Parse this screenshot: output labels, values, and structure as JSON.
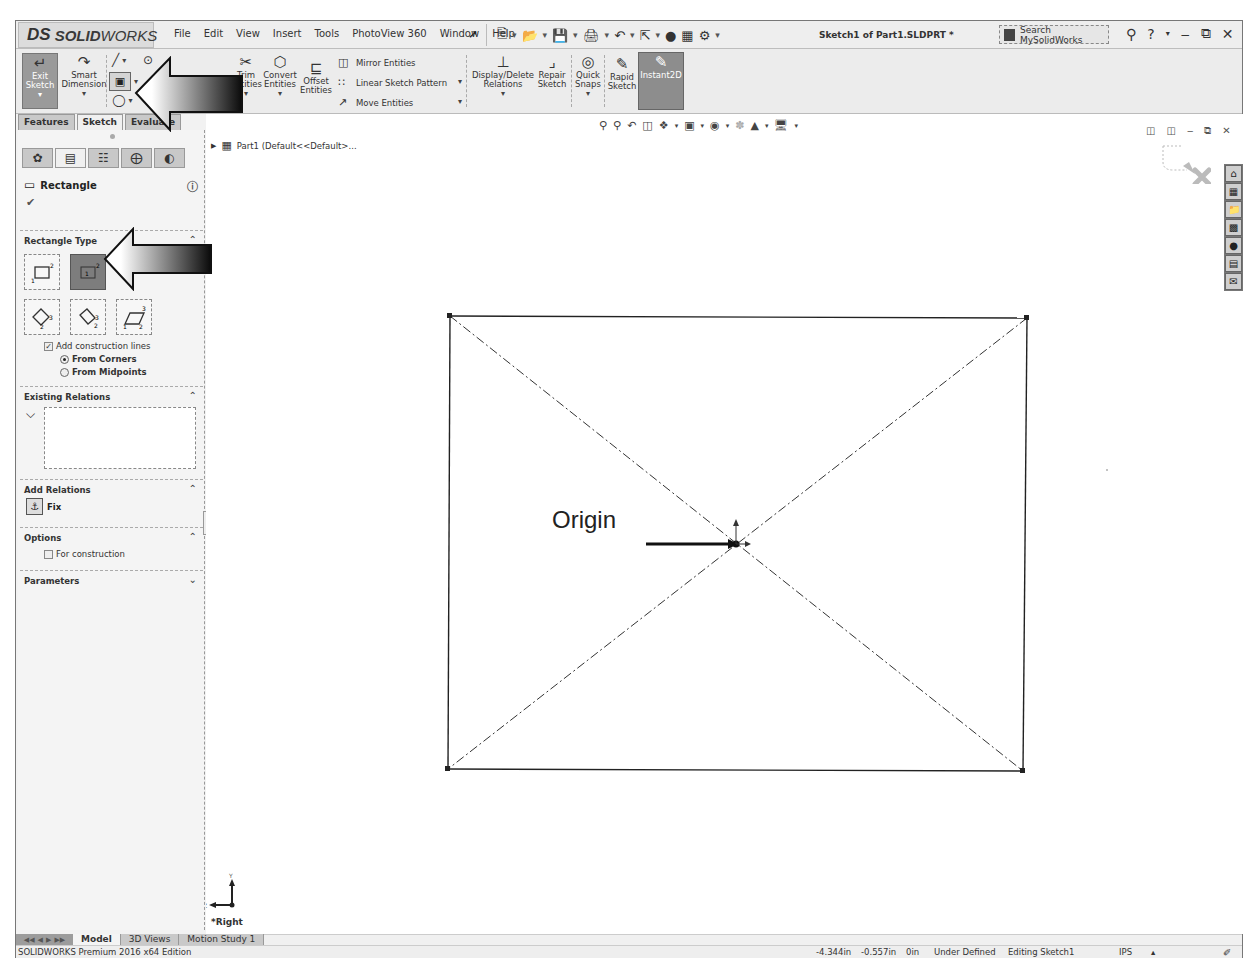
{
  "app": {
    "logo_prefix": "DS",
    "logo_bold": "SOLID",
    "logo_rest": "WORKS",
    "menu": [
      "File",
      "Edit",
      "View",
      "Insert",
      "Tools",
      "PhotoView 360",
      "Window",
      "Help"
    ],
    "document_title": "Sketch1 of Part1.SLDPRT *",
    "search_placeholder": "Search MySolidWorks",
    "help_label": "?"
  },
  "command_manager": {
    "exit_sketch": "Exit\nSketch",
    "smart_dimension": "Smart\nDimension",
    "trim_entities": "Trim\nEntities",
    "convert_entities": "Convert\nEntities",
    "offset_entities": "Offset\nEntities",
    "mirror_entities": "Mirror Entities",
    "linear_sketch_pattern": "Linear Sketch Pattern",
    "move_entities": "Move Entities",
    "display_delete_relations": "Display/Delete\nRelations",
    "repair_sketch": "Repair\nSketch",
    "quick_snaps": "Quick\nSnaps",
    "rapid_sketch": "Rapid\nSketch",
    "instant2d": "Instant2D",
    "tabs": [
      "Features",
      "Sketch",
      "Evaluate"
    ],
    "active_tab": "Sketch"
  },
  "property_manager": {
    "title": "Rectangle",
    "sections": {
      "rectangle_type": "Rectangle Type",
      "existing_relations": "Existing Relations",
      "add_relations": "Add Relations",
      "options": "Options",
      "parameters": "Parameters"
    },
    "rectangle_types": [
      "Corner Rectangle",
      "Center Rectangle",
      "3 Point Corner Rectangle",
      "3 Point Center Rectangle",
      "Parallelogram"
    ],
    "active_rectangle_type": "Center Rectangle",
    "add_construction_lines": "Add construction lines",
    "add_construction_lines_checked": true,
    "radio_options": [
      "From Corners",
      "From Midpoints"
    ],
    "radio_selected": "From Corners",
    "fix_label": "Fix",
    "for_construction": "For construction",
    "for_construction_checked": false
  },
  "graphics": {
    "tree_item": "Part1  (Default<<Default>...",
    "origin_annotation": "Origin",
    "view_name": "*Right",
    "triad_labels": {
      "up": "Y",
      "left": "Z"
    },
    "rectangle": {
      "x1": 244,
      "y1": 202,
      "x2": 819,
      "y2": 657
    },
    "origin": {
      "x": 529,
      "y": 430
    }
  },
  "bottom_tabs": [
    "Model",
    "3D Views",
    "Motion Study 1"
  ],
  "active_bottom_tab": "Model",
  "status_bar": {
    "edition": "SOLIDWORKS Premium 2016 x64 Edition",
    "x": "-4.344in",
    "y": "-0.557in",
    "z": "0in",
    "state": "Under Defined",
    "mode": "Editing Sketch1",
    "units": "IPS"
  }
}
